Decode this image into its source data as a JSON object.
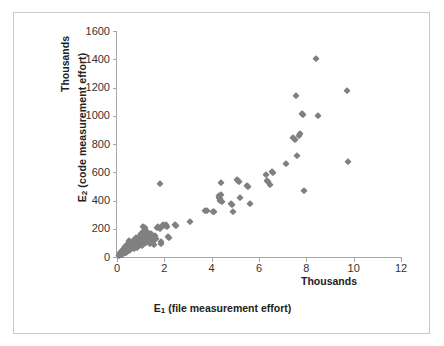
{
  "chart_data": {
    "type": "scatter",
    "title": "",
    "xlabel": "E₁ (file measurement effort)",
    "ylabel": "E₂ (code measurement effort)",
    "x_unit_label": "Thousands",
    "y_unit_label": "Thousands",
    "xlim": [
      0,
      12
    ],
    "ylim": [
      0,
      1600
    ],
    "xticks": [
      0,
      2,
      4,
      6,
      8,
      10,
      12
    ],
    "yticks": [
      0,
      200,
      400,
      600,
      800,
      1000,
      1200,
      1400,
      1600
    ],
    "grid": false,
    "legend": false,
    "marker": "diamond",
    "marker_color": "#808080",
    "series": [
      {
        "name": "E1 vs E2",
        "points": [
          [
            0.1,
            10
          ],
          [
            0.12,
            18
          ],
          [
            0.14,
            25
          ],
          [
            0.15,
            12
          ],
          [
            0.17,
            30
          ],
          [
            0.18,
            22
          ],
          [
            0.2,
            40
          ],
          [
            0.21,
            15
          ],
          [
            0.22,
            35
          ],
          [
            0.24,
            28
          ],
          [
            0.25,
            48
          ],
          [
            0.26,
            20
          ],
          [
            0.28,
            55
          ],
          [
            0.29,
            33
          ],
          [
            0.3,
            42
          ],
          [
            0.31,
            60
          ],
          [
            0.33,
            25
          ],
          [
            0.34,
            50
          ],
          [
            0.35,
            70
          ],
          [
            0.36,
            38
          ],
          [
            0.38,
            58
          ],
          [
            0.39,
            30
          ],
          [
            0.4,
            78
          ],
          [
            0.41,
            45
          ],
          [
            0.43,
            65
          ],
          [
            0.44,
            35
          ],
          [
            0.45,
            90
          ],
          [
            0.46,
            52
          ],
          [
            0.48,
            72
          ],
          [
            0.49,
            42
          ],
          [
            0.5,
            112
          ],
          [
            0.52,
            60
          ],
          [
            0.53,
            85
          ],
          [
            0.55,
            48
          ],
          [
            0.56,
            100
          ],
          [
            0.58,
            68
          ],
          [
            0.6,
            55
          ],
          [
            0.62,
            95
          ],
          [
            0.64,
            75
          ],
          [
            0.66,
            62
          ],
          [
            0.68,
            110
          ],
          [
            0.7,
            80
          ],
          [
            0.72,
            58
          ],
          [
            0.74,
            120
          ],
          [
            0.76,
            92
          ],
          [
            0.78,
            70
          ],
          [
            0.8,
            135
          ],
          [
            0.82,
            105
          ],
          [
            0.84,
            82
          ],
          [
            0.86,
            65
          ],
          [
            0.88,
            128
          ],
          [
            0.9,
            98
          ],
          [
            0.92,
            75
          ],
          [
            0.94,
            145
          ],
          [
            0.96,
            115
          ],
          [
            0.98,
            88
          ],
          [
            1.0,
            160
          ],
          [
            1.02,
            130
          ],
          [
            1.04,
            105
          ],
          [
            1.06,
            78
          ],
          [
            1.08,
            175
          ],
          [
            1.1,
            210
          ],
          [
            1.12,
            140
          ],
          [
            1.14,
            112
          ],
          [
            1.16,
            90
          ],
          [
            1.18,
            205
          ],
          [
            1.2,
            155
          ],
          [
            1.22,
            125
          ],
          [
            1.24,
            100
          ],
          [
            1.26,
            180
          ],
          [
            1.3,
            148
          ],
          [
            1.34,
            118
          ],
          [
            1.38,
            95
          ],
          [
            1.42,
            165
          ],
          [
            1.46,
            135
          ],
          [
            1.5,
            108
          ],
          [
            1.55,
            85
          ],
          [
            1.6,
            150
          ],
          [
            1.65,
            125
          ],
          [
            1.7,
            205
          ],
          [
            1.75,
            210
          ],
          [
            1.8,
            200
          ],
          [
            1.82,
            520
          ],
          [
            1.85,
            105
          ],
          [
            1.88,
            95
          ],
          [
            1.95,
            225
          ],
          [
            2.0,
            220
          ],
          [
            2.05,
            230
          ],
          [
            2.1,
            215
          ],
          [
            2.15,
            140
          ],
          [
            2.2,
            135
          ],
          [
            2.45,
            225
          ],
          [
            2.5,
            222
          ],
          [
            3.1,
            250
          ],
          [
            3.7,
            325
          ],
          [
            3.8,
            325
          ],
          [
            4.05,
            320
          ],
          [
            4.1,
            320
          ],
          [
            4.3,
            430
          ],
          [
            4.32,
            420
          ],
          [
            4.34,
            410
          ],
          [
            4.36,
            400
          ],
          [
            4.38,
            440
          ],
          [
            4.4,
            525
          ],
          [
            4.42,
            390
          ],
          [
            4.8,
            375
          ],
          [
            4.85,
            365
          ],
          [
            4.9,
            320
          ],
          [
            5.05,
            545
          ],
          [
            5.1,
            540
          ],
          [
            5.15,
            530
          ],
          [
            5.2,
            420
          ],
          [
            5.5,
            500
          ],
          [
            5.55,
            498
          ],
          [
            5.6,
            375
          ],
          [
            6.3,
            580
          ],
          [
            6.35,
            540
          ],
          [
            6.4,
            530
          ],
          [
            6.45,
            510
          ],
          [
            6.55,
            600
          ],
          [
            6.6,
            595
          ],
          [
            7.15,
            660
          ],
          [
            7.45,
            840
          ],
          [
            7.5,
            830
          ],
          [
            7.55,
            1140
          ],
          [
            7.6,
            715
          ],
          [
            7.7,
            860
          ],
          [
            7.75,
            870
          ],
          [
            7.8,
            1015
          ],
          [
            7.85,
            1005
          ],
          [
            7.9,
            470
          ],
          [
            8.4,
            1405
          ],
          [
            8.5,
            1000
          ],
          [
            9.7,
            1175
          ],
          [
            9.75,
            670
          ]
        ]
      }
    ]
  },
  "axes": {
    "y_title": "E₂ (code measurement effort)",
    "y_unit": "Thousands",
    "x_title": "E₁ (file measurement effort)",
    "x_unit": "Thousands"
  }
}
